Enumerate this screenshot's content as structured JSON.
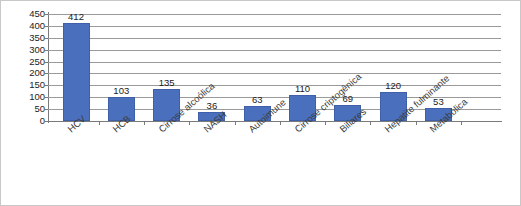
{
  "chart_data": {
    "type": "bar",
    "title": "",
    "subtitle": "",
    "xlabel": "",
    "ylabel": "",
    "ylim": [
      0,
      450
    ],
    "ytick_step": 50,
    "yticks": [
      "450",
      "400",
      "350",
      "300",
      "250",
      "200",
      "150",
      "100",
      "50",
      "0"
    ],
    "grid": true,
    "legend": "none",
    "bar_color": "#4a6fbd",
    "categories": [
      "HCV",
      "HCB",
      "Cirrose alcoólica",
      "NASH",
      "Autoimune",
      "Cirrose criptogênica",
      "Biliares",
      "Hepatite fulminante",
      "Metabólica"
    ],
    "values": [
      412,
      103,
      135,
      36,
      63,
      110,
      69,
      120,
      53
    ],
    "data_labels": [
      "412",
      "103",
      "135",
      "36",
      "63",
      "110",
      "69",
      "120",
      "53"
    ]
  }
}
